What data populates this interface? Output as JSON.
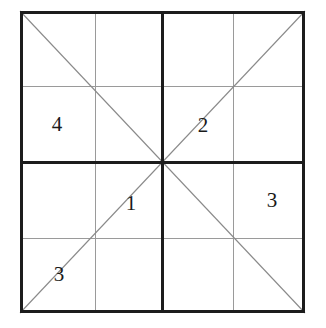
{
  "figure": {
    "type": "geometric-diagram",
    "artifact_note": "illegible cropped text fragment at top edge",
    "colors": {
      "background": "#ffffff",
      "major_line": "#1c1c1c",
      "minor_line": "#9a9a9a",
      "diagonal_line": "#8a8a8a",
      "label_text": "#1a1a1a"
    },
    "square": {
      "left": 20,
      "top": 11,
      "right": 305,
      "bottom": 313,
      "major_stroke_width": 3,
      "minor_stroke_width": 1,
      "diagonal_stroke_width": 1
    },
    "major_lines": [
      {
        "name": "outer-border",
        "orientation": "rect"
      },
      {
        "name": "center-vertical",
        "orientation": "vertical",
        "position": 162
      },
      {
        "name": "center-horizontal",
        "orientation": "horizontal",
        "position": 162
      }
    ],
    "minor_lines": [
      {
        "name": "quarter-vertical-left",
        "orientation": "vertical",
        "position": 95
      },
      {
        "name": "quarter-vertical-right",
        "orientation": "vertical",
        "position": 233
      },
      {
        "name": "quarter-horizontal-top",
        "orientation": "horizontal",
        "position": 86
      },
      {
        "name": "quarter-horizontal-bottom",
        "orientation": "horizontal",
        "position": 238
      }
    ],
    "diagonals": [
      {
        "name": "diagonal-falling",
        "from": "top-left",
        "to": "bottom-right"
      },
      {
        "name": "diagonal-rising",
        "from": "bottom-left",
        "to": "top-right"
      }
    ],
    "labels": [
      {
        "name": "label-4",
        "text": "4",
        "x": 57,
        "y": 124,
        "region": "upper-left-quadrant"
      },
      {
        "name": "label-2",
        "text": "2",
        "x": 203,
        "y": 125,
        "region": "upper-right-quadrant-on-rising-diagonal"
      },
      {
        "name": "label-1",
        "text": "1",
        "x": 131,
        "y": 203,
        "region": "lower-left-quadrant-on-rising-diagonal"
      },
      {
        "name": "label-3-right",
        "text": "3",
        "x": 272,
        "y": 200,
        "region": "lower-right-quadrant"
      },
      {
        "name": "label-3-bottom",
        "text": "3",
        "x": 59,
        "y": 274,
        "region": "bottom-left-corner-on-rising-diagonal"
      }
    ]
  }
}
